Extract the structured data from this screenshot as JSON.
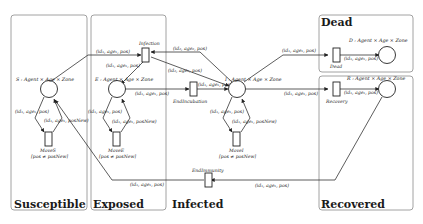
{
  "regions": {
    "susceptible": "Susceptible",
    "exposed": "Exposed",
    "infected": "Infected",
    "dead": "Dead",
    "recovered": "Recovered"
  },
  "places": {
    "S": "S : Agent × Age × Zone",
    "E": "E : Agent × Age × Zone",
    "I": "I : Agent × Age × Zone",
    "D": "D : Agent × Age × Zone",
    "R": "R : Agent × Age × Zone"
  },
  "transitions": {
    "infection": "Infection",
    "end_incubation": "EndIncubation",
    "dead": "Dead",
    "recovery": "Recovery",
    "end_immunity": "EndImmunity",
    "moveS": "MoveS",
    "moveS_guard": "[pos ≠ posNew]",
    "moveE": "MoveE",
    "moveE_guard": "[pos ≠ posNew]",
    "moveI": "MoveI",
    "moveI_guard": "[pos ≠ posNew]"
  },
  "arcs": {
    "s_to_infection": "(id₁, age₁, pos)",
    "infection_to_e": "(id₁, age₁, pos)",
    "i_to_infection": "(id₂, age₂, pos)",
    "infection_to_i": "(id₂, age₂, pos)",
    "e_to_endincubation": "(id₁, age₁, pos)",
    "endincubation_to_i": "(id₁, age₁, pos)",
    "i_to_dead": "(id₁, age₁, pos)",
    "dead_to_d": "(id₁, age₁, pos)",
    "i_to_recovery": "(id₁, age₁, pos)",
    "recovery_to_r": "(id₁, age₁, pos)",
    "r_to_endimmunity": "(id₁, age₁, pos)",
    "endimmunity_to_s": "(id₁, age₁, pos)",
    "s_to_moveS": "(id₁, age₁, pos)",
    "moveS_to_s": "(id₁, age₁, posNew)",
    "e_to_moveE": "(id₁, age₁, pos)",
    "moveE_to_e": "(id₁, age₁, posNew)",
    "i_to_moveI": "(id₁, age₁, pos)",
    "moveI_to_i": "(id₁, age₁, posNew)"
  }
}
